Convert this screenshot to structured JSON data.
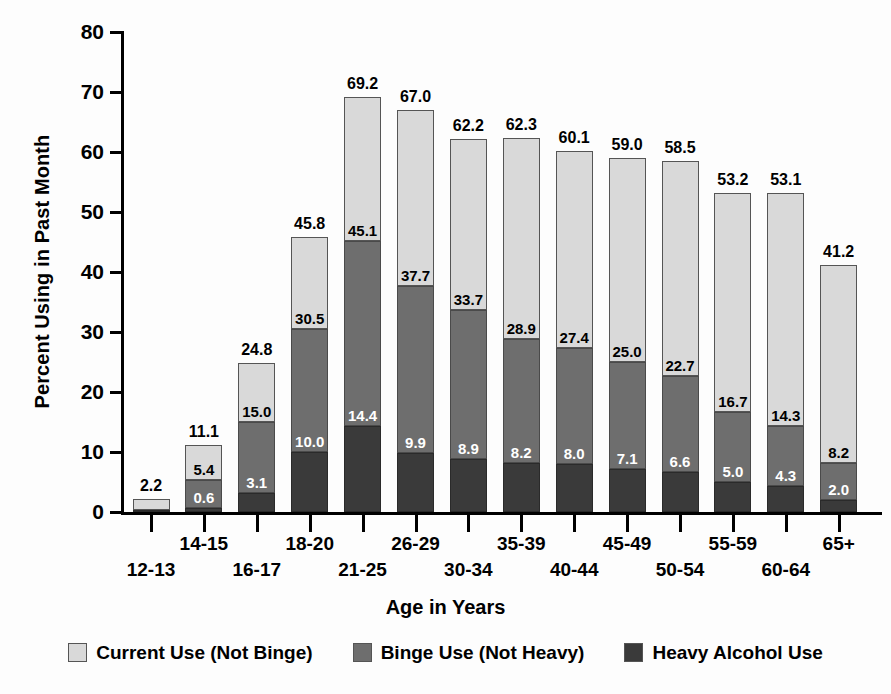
{
  "chart_data": {
    "type": "bar",
    "subtype": "stacked-bar",
    "title": "",
    "xlabel": "Age in Years",
    "ylabel": "Percent Using in Past Month",
    "ylim": [
      0,
      80
    ],
    "yticks": [
      0,
      10,
      20,
      30,
      40,
      50,
      60,
      70,
      80
    ],
    "ytick_labels": [
      "0",
      "10",
      "20",
      "30",
      "40",
      "50",
      "60",
      "70",
      "80"
    ],
    "grid": false,
    "legend_position": "bottom",
    "categories": [
      "12-13",
      "14-15",
      "16-17",
      "18-20",
      "21-25",
      "26-29",
      "30-34",
      "35-39",
      "40-44",
      "45-49",
      "50-54",
      "55-59",
      "60-64",
      "65+"
    ],
    "series": [
      {
        "name": "Heavy Alcohol Use",
        "color": "#3a3a3a",
        "values": [
          0.3,
          0.6,
          3.1,
          10.0,
          14.4,
          9.9,
          8.9,
          8.2,
          8.0,
          7.1,
          6.6,
          5.0,
          4.3,
          2.0
        ],
        "labels": [
          "",
          "0.6",
          "3.1",
          "10.0",
          "14.4",
          "9.9",
          "8.9",
          "8.2",
          "8.0",
          "7.1",
          "6.6",
          "5.0",
          "4.3",
          "2.0"
        ]
      },
      {
        "name": "Binge Use (Not Heavy)",
        "color": "#6e6e6e",
        "values": [
          0.4,
          5.4,
          15.0,
          30.5,
          45.1,
          37.7,
          33.7,
          28.9,
          27.4,
          25.0,
          22.7,
          16.7,
          14.3,
          8.2
        ],
        "labels": [
          "",
          "5.4",
          "15.0",
          "30.5",
          "45.1",
          "37.7",
          "33.7",
          "28.9",
          "27.4",
          "25.0",
          "22.7",
          "16.7",
          "14.3",
          "8.2"
        ],
        "note": "Value shown is the cumulative top of the dark+mid stack"
      },
      {
        "name": "Current Use (Not Binge)",
        "color": "#d9d9d9",
        "values": [
          2.2,
          11.1,
          24.8,
          45.8,
          69.2,
          67.0,
          62.2,
          62.3,
          60.1,
          59.0,
          58.5,
          53.2,
          53.1,
          41.2
        ],
        "labels": [
          "2.2",
          "11.1",
          "24.8",
          "45.8",
          "69.2",
          "67.0",
          "62.2",
          "62.3",
          "60.1",
          "59.0",
          "58.5",
          "53.2",
          "53.1",
          "41.2"
        ],
        "note": "Value shown is the total bar height"
      }
    ],
    "bars": [
      {
        "category": "12-13",
        "total": "2.2",
        "heavy": 0.3,
        "heavy_label": "",
        "binge_top": 0.4,
        "binge_label": "",
        "total_value": 2.2
      },
      {
        "category": "14-15",
        "total": "11.1",
        "heavy": 0.6,
        "heavy_label": "0.6",
        "binge_top": 5.4,
        "binge_label": "5.4",
        "total_value": 11.1
      },
      {
        "category": "16-17",
        "total": "24.8",
        "heavy": 3.1,
        "heavy_label": "3.1",
        "binge_top": 15.0,
        "binge_label": "15.0",
        "total_value": 24.8
      },
      {
        "category": "18-20",
        "total": "45.8",
        "heavy": 10.0,
        "heavy_label": "10.0",
        "binge_top": 30.5,
        "binge_label": "30.5",
        "total_value": 45.8
      },
      {
        "category": "21-25",
        "total": "69.2",
        "heavy": 14.4,
        "heavy_label": "14.4",
        "binge_top": 45.1,
        "binge_label": "45.1",
        "total_value": 69.2
      },
      {
        "category": "26-29",
        "total": "67.0",
        "heavy": 9.9,
        "heavy_label": "9.9",
        "binge_top": 37.7,
        "binge_label": "37.7",
        "total_value": 67.0
      },
      {
        "category": "30-34",
        "total": "62.2",
        "heavy": 8.9,
        "heavy_label": "8.9",
        "binge_top": 33.7,
        "binge_label": "33.7",
        "total_value": 62.2
      },
      {
        "category": "35-39",
        "total": "62.3",
        "heavy": 8.2,
        "heavy_label": "8.2",
        "binge_top": 28.9,
        "binge_label": "28.9",
        "total_value": 62.3
      },
      {
        "category": "40-44",
        "total": "60.1",
        "heavy": 8.0,
        "heavy_label": "8.0",
        "binge_top": 27.4,
        "binge_label": "27.4",
        "total_value": 60.1
      },
      {
        "category": "45-49",
        "total": "59.0",
        "heavy": 7.1,
        "heavy_label": "7.1",
        "binge_top": 25.0,
        "binge_label": "25.0",
        "total_value": 59.0
      },
      {
        "category": "50-54",
        "total": "58.5",
        "heavy": 6.6,
        "heavy_label": "6.6",
        "binge_top": 22.7,
        "binge_label": "22.7",
        "total_value": 58.5
      },
      {
        "category": "55-59",
        "total": "53.2",
        "heavy": 5.0,
        "heavy_label": "5.0",
        "binge_top": 16.7,
        "binge_label": "16.7",
        "total_value": 53.2
      },
      {
        "category": "60-64",
        "total": "53.1",
        "heavy": 4.3,
        "heavy_label": "4.3",
        "binge_top": 14.3,
        "binge_label": "14.3",
        "total_value": 53.1
      },
      {
        "category": "65+",
        "total": "41.2",
        "heavy": 2.0,
        "heavy_label": "2.0",
        "binge_top": 8.2,
        "binge_label": "8.2",
        "total_value": 41.2
      }
    ],
    "legend": [
      {
        "label": "Current Use (Not Binge)",
        "color": "#d9d9d9"
      },
      {
        "label": "Binge Use (Not Heavy)",
        "color": "#6e6e6e"
      },
      {
        "label": "Heavy Alcohol Use",
        "color": "#3a3a3a"
      }
    ]
  }
}
